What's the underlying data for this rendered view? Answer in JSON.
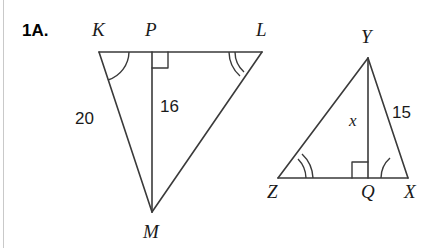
{
  "problem": {
    "number": "1A."
  },
  "figure": {
    "stroke_color": "#3a3a3a",
    "text_color": "#1a1a1a",
    "background": "#ffffff",
    "page_rule_color": "#c9c9c9"
  },
  "triangles": [
    {
      "name": "KLM",
      "vertices": [
        {
          "id": "K",
          "label": "K",
          "x": 99,
          "y": 52
        },
        {
          "id": "L",
          "label": "L",
          "x": 262,
          "y": 52
        },
        {
          "id": "M",
          "label": "M",
          "x": 152,
          "y": 212
        }
      ],
      "foot": {
        "id": "P",
        "label": "P",
        "x": 152,
        "y": 52
      },
      "altitude": {
        "from": "P",
        "to": "M",
        "label": "16",
        "right_angle_at": "P"
      },
      "side_labels": [
        {
          "text": "20",
          "side": "KM"
        },
        {
          "text": "16",
          "side": "PM"
        }
      ],
      "angle_marks": [
        {
          "at": "K",
          "arcs": 1
        },
        {
          "at": "L",
          "arcs": 2
        }
      ]
    },
    {
      "name": "XYZ",
      "vertices": [
        {
          "id": "Y",
          "label": "Y",
          "x": 368,
          "y": 58
        },
        {
          "id": "Z",
          "label": "Z",
          "x": 278,
          "y": 178
        },
        {
          "id": "X",
          "label": "X",
          "x": 408,
          "y": 178
        }
      ],
      "foot": {
        "id": "Q",
        "label": "Q",
        "x": 368,
        "y": 178
      },
      "altitude": {
        "from": "Y",
        "to": "Q",
        "label": "x",
        "right_angle_at": "Q"
      },
      "side_labels": [
        {
          "text": "15",
          "side": "YX"
        },
        {
          "text": "x",
          "side": "YQ"
        }
      ],
      "angle_marks": [
        {
          "at": "Z",
          "arcs": 2
        },
        {
          "at": "X",
          "arcs": 1
        }
      ]
    }
  ],
  "labels": {
    "K": "K",
    "P": "P",
    "L": "L",
    "M": "M",
    "Y": "Y",
    "Z": "Z",
    "Q": "Q",
    "X": "X",
    "len_20": "20",
    "len_16": "16",
    "len_15": "15",
    "var_x": "x"
  }
}
